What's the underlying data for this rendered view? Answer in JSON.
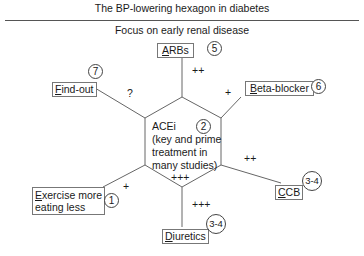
{
  "title": "The BP-lowering hexagon in diabetes",
  "subtitle": "Focus on early renal disease",
  "center": {
    "label": "ACEi",
    "lines": [
      "(key and prime",
      "treatment in",
      "many studies)"
    ],
    "rank": "2"
  },
  "nodes": [
    {
      "id": "arbs",
      "label": "ARBs",
      "rank": "5",
      "strength": "++"
    },
    {
      "id": "beta-blocker",
      "label": "Beta-blocker",
      "rank": "6",
      "strength": "+"
    },
    {
      "id": "ccb",
      "label": "CCB",
      "rank": "3-4",
      "strength": "++"
    },
    {
      "id": "diuretics",
      "label": "Diuretics",
      "rank": "3-4",
      "strength": "+++"
    },
    {
      "id": "exercise",
      "label_lines": [
        "Exercise more",
        "eating less"
      ],
      "rank": "1",
      "strength": "+"
    },
    {
      "id": "find-out",
      "label": "Find-out",
      "rank": "7",
      "strength": "?"
    }
  ],
  "center_strength": "+++"
}
